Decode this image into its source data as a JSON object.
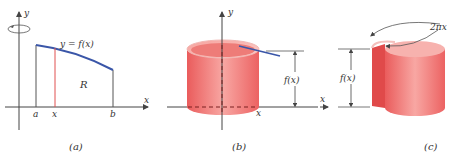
{
  "panels": [
    {
      "id": "a",
      "caption": "(a)",
      "axis_x": "x",
      "axis_y": "y",
      "curve_label": "y = f(x)",
      "region_label": "R",
      "tick_a": "a",
      "tick_x": "x",
      "tick_b": "b"
    },
    {
      "id": "b",
      "caption": "(b)",
      "axis_y": "y",
      "axis_x": "x",
      "height_label": "f(x)"
    },
    {
      "id": "c",
      "caption": "(c)",
      "axis_x": "x",
      "height_label": "f(x)",
      "circumference_label": "2πx"
    }
  ],
  "colors": {
    "curve": "#3a56a8",
    "strip": "#e05050",
    "cylinder": "#ef6e6e",
    "cylinder_light": "#f7a9a6",
    "axis": "#444444"
  }
}
